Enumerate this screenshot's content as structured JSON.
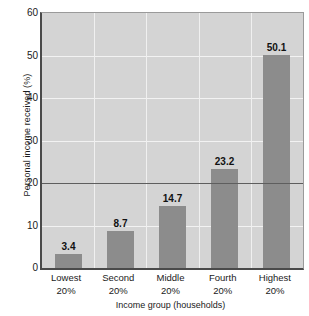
{
  "chart_data": {
    "type": "bar",
    "title": "",
    "xlabel": "Income group (households)",
    "ylabel": "Personal income received (%)",
    "categories": [
      "Lowest 20%",
      "Second 20%",
      "Middle 20%",
      "Fourth 20%",
      "Highest 20%"
    ],
    "category_lines": [
      [
        "Lowest",
        "20%"
      ],
      [
        "Second",
        "20%"
      ],
      [
        "Middle",
        "20%"
      ],
      [
        "Fourth",
        "20%"
      ],
      [
        "Highest",
        "20%"
      ]
    ],
    "values": [
      3.4,
      8.7,
      14.7,
      23.2,
      50.1
    ],
    "value_labels": [
      "3.4",
      "8.7",
      "14.7",
      "23.2",
      "50.1"
    ],
    "ylim": [
      0,
      60
    ],
    "yticks": [
      0,
      10,
      20,
      30,
      40,
      50,
      60
    ],
    "ytick_labels": [
      "0",
      "10",
      "20",
      "30",
      "40",
      "50",
      "60"
    ],
    "grid": true,
    "legend": "none",
    "reference_line": 20,
    "colors": {
      "bar": "#8c8c8c",
      "plot_background": "#d4d4d4",
      "gridline": "#f2f2f2",
      "axis": "#4a4a4a",
      "reference_line": "#5e5e5e",
      "text": "#1a1a1a"
    }
  }
}
